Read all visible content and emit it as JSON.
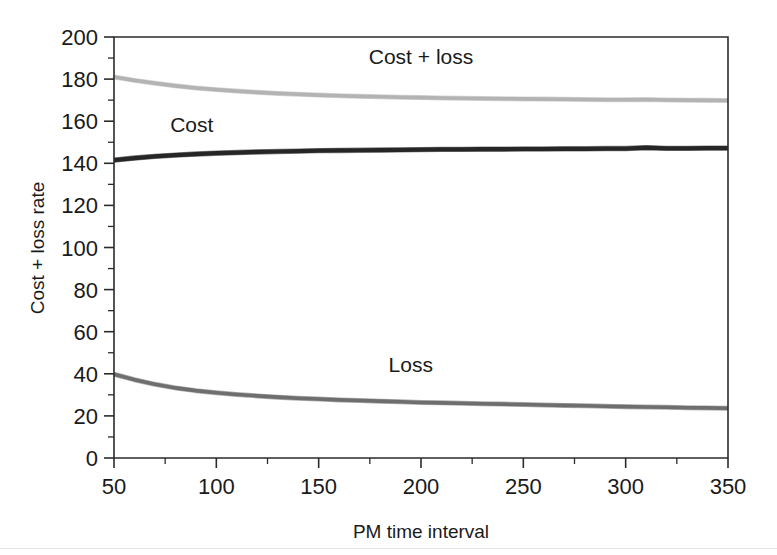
{
  "chart_data": {
    "type": "line",
    "title": "",
    "subtitle": "",
    "xlabel": "PM time interval",
    "ylabel": "Cost + loss rate",
    "xlim": [
      50,
      350
    ],
    "ylim": [
      0,
      200
    ],
    "grid": false,
    "legend_position": "inline-labels",
    "x_ticks": [
      50,
      100,
      150,
      200,
      250,
      300,
      350
    ],
    "x_tick_labels": [
      "50",
      "100",
      "150",
      "200",
      "250",
      "300",
      "350"
    ],
    "x_minor_step": 25,
    "y_ticks": [
      0,
      20,
      40,
      60,
      80,
      100,
      120,
      140,
      160,
      180,
      200
    ],
    "y_tick_labels": [
      "0",
      "20",
      "40",
      "60",
      "80",
      "100",
      "120",
      "140",
      "160",
      "180",
      "200"
    ],
    "y_minor_step": 10,
    "x": [
      50,
      60,
      70,
      80,
      90,
      100,
      110,
      120,
      130,
      140,
      150,
      160,
      170,
      180,
      190,
      200,
      210,
      220,
      230,
      240,
      250,
      260,
      270,
      280,
      290,
      300,
      310,
      320,
      330,
      340,
      350
    ],
    "series": [
      {
        "name": "Cost + loss",
        "color": "#b3b3b3",
        "label": "Cost + loss",
        "label_x": 200,
        "label_y": 187,
        "values": [
          181.0,
          179.4,
          178.0,
          176.8,
          175.8,
          175.0,
          174.3,
          173.7,
          173.2,
          172.8,
          172.4,
          172.1,
          171.8,
          171.6,
          171.4,
          171.2,
          171.0,
          170.9,
          170.8,
          170.7,
          170.6,
          170.5,
          170.4,
          170.3,
          170.2,
          170.2,
          170.3,
          170.1,
          170.0,
          169.9,
          169.8
        ]
      },
      {
        "name": "Cost",
        "color": "#262626",
        "label": "Cost",
        "label_x": 88,
        "label_y": 155,
        "values": [
          141.5,
          142.5,
          143.3,
          143.9,
          144.4,
          144.8,
          145.1,
          145.4,
          145.6,
          145.8,
          146.0,
          146.1,
          146.2,
          146.3,
          146.4,
          146.5,
          146.6,
          146.6,
          146.7,
          146.7,
          146.8,
          146.8,
          146.9,
          146.9,
          147.0,
          147.0,
          147.4,
          147.1,
          147.1,
          147.2,
          147.2
        ]
      },
      {
        "name": "Loss",
        "color": "#6e6e6e",
        "label": "Loss",
        "label_x": 195,
        "label_y": 41,
        "values": [
          39.8,
          37.2,
          35.0,
          33.3,
          32.0,
          31.0,
          30.2,
          29.5,
          28.9,
          28.4,
          28.0,
          27.6,
          27.3,
          27.0,
          26.7,
          26.4,
          26.2,
          26.0,
          25.8,
          25.6,
          25.4,
          25.2,
          25.0,
          24.8,
          24.6,
          24.4,
          24.2,
          24.1,
          23.9,
          23.8,
          23.6
        ]
      }
    ]
  }
}
